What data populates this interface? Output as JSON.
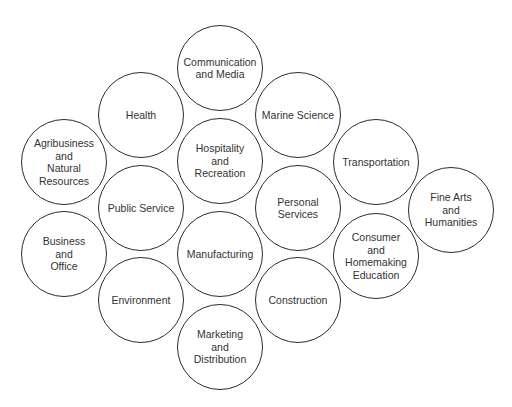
{
  "diagram": {
    "style": {
      "stroke_color": "#2b2b2b",
      "text_color": "#333333",
      "background": "#ffffff",
      "radius": 43
    },
    "nodes": [
      {
        "id": "communication-and-media",
        "label": "Communication\nand Media",
        "cx": 220,
        "cy": 68
      },
      {
        "id": "health",
        "label": "Health",
        "cx": 141,
        "cy": 115
      },
      {
        "id": "marine-science",
        "label": "Marine Science",
        "cx": 298,
        "cy": 115
      },
      {
        "id": "agribusiness-and-natural-resources",
        "label": "Agribusiness\nand\nNatural\nResources",
        "cx": 64,
        "cy": 162
      },
      {
        "id": "hospitality-and-recreation",
        "label": "Hospitality\nand\nRecreation",
        "cx": 220,
        "cy": 161
      },
      {
        "id": "transportation",
        "label": "Transportation",
        "cx": 376,
        "cy": 162
      },
      {
        "id": "public-service",
        "label": "Public Service",
        "cx": 141,
        "cy": 208
      },
      {
        "id": "personal-services",
        "label": "Personal\nServices",
        "cx": 298,
        "cy": 208
      },
      {
        "id": "fine-arts-and-humanities",
        "label": "Fine Arts\nand\nHumanities",
        "cx": 451,
        "cy": 210
      },
      {
        "id": "business-and-office",
        "label": "Business\nand\nOffice",
        "cx": 64,
        "cy": 254
      },
      {
        "id": "manufacturing",
        "label": "Manufacturing",
        "cx": 220,
        "cy": 254
      },
      {
        "id": "consumer-and-homemaking-education",
        "label": "Consumer\nand\nHomemaking\nEducation",
        "cx": 376,
        "cy": 256
      },
      {
        "id": "environment",
        "label": "Environment",
        "cx": 141,
        "cy": 300
      },
      {
        "id": "construction",
        "label": "Construction",
        "cx": 298,
        "cy": 300
      },
      {
        "id": "marketing-and-distribution",
        "label": "Marketing\nand\nDistribution",
        "cx": 220,
        "cy": 347
      }
    ]
  }
}
